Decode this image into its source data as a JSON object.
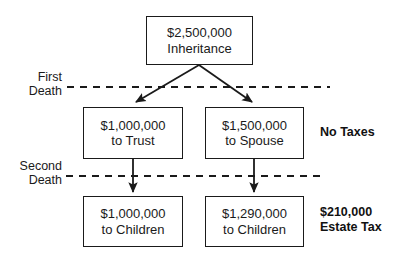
{
  "diagram": {
    "background_color": "#ffffff",
    "line_color": "#1a1a1a",
    "text_color": "#1a1a1a"
  },
  "nodes": {
    "inheritance": {
      "amount": "$2,500,000",
      "recipient": "Inheritance"
    },
    "trust": {
      "amount": "$1,000,000",
      "recipient": "to Trust"
    },
    "spouse": {
      "amount": "$1,500,000",
      "recipient": "to Spouse"
    },
    "children_left": {
      "amount": "$1,000,000",
      "recipient": "to Children"
    },
    "children_right": {
      "amount": "$1,290,000",
      "recipient": "to Children"
    }
  },
  "stages": {
    "first_death": {
      "line1": "First",
      "line2": "Death"
    },
    "second_death": {
      "line1": "Second",
      "line2": "Death"
    }
  },
  "notes": {
    "no_taxes": {
      "line1": "No Taxes",
      "line2": ""
    },
    "estate_tax": {
      "line1": "$210,000",
      "line2": "Estate Tax"
    }
  }
}
